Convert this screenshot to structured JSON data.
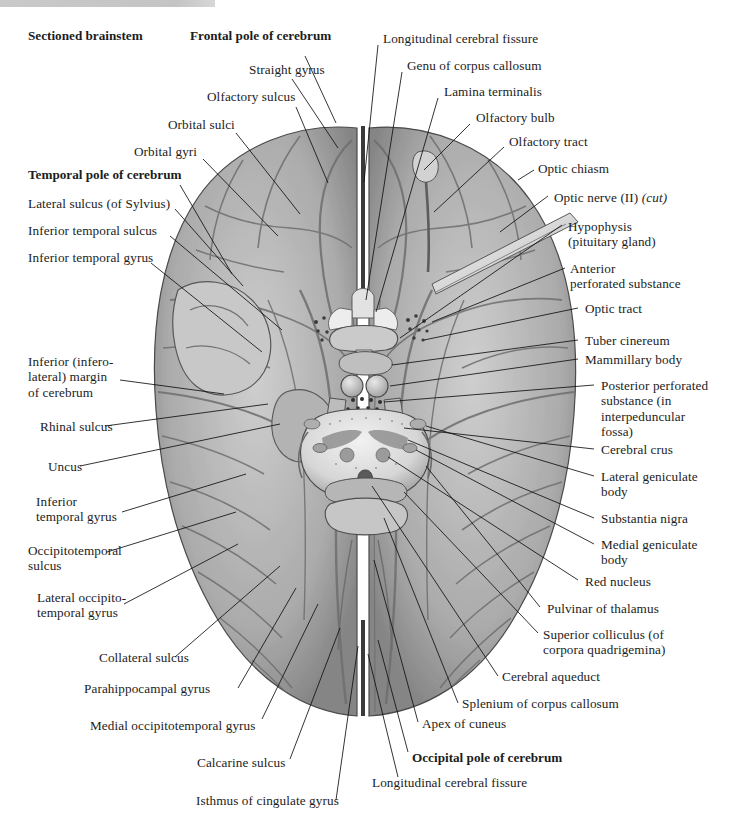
{
  "figure": {
    "kind": "anatomical-illustration",
    "top_rule_color": "#c7c7c7"
  },
  "labels": {
    "sectioned_brainstem": "Sectioned brainstem",
    "frontal_pole": "Frontal pole of cerebrum",
    "longitudinal_fissure_top": "Longitudinal cerebral fissure",
    "straight_gyrus": "Straight gyrus",
    "genu_corpus_callosum": "Genu of corpus callosum",
    "olfactory_sulcus": "Olfactory sulcus",
    "lamina_terminalis": "Lamina terminalis",
    "orbital_sulci": "Orbital sulci",
    "olfactory_bulb": "Olfactory bulb",
    "orbital_gyri": "Orbital gyri",
    "olfactory_tract": "Olfactory tract",
    "temporal_pole": "Temporal pole of cerebrum",
    "optic_chiasm": "Optic chiasm",
    "optic_nerve_a": "Optic nerve (II) ",
    "optic_nerve_cut": "(cut)",
    "lateral_sulcus": "Lateral sulcus (of Sylvius)",
    "hypophysis_l1": "Hypophysis",
    "hypophysis_l2": "(pituitary gland)",
    "inferior_temporal_sulcus": "Inferior temporal sulcus",
    "inferior_temporal_gyrus_top": "Inferior temporal gyrus",
    "anterior_perforated_l1": "Anterior",
    "anterior_perforated_l2": "perforated substance",
    "optic_tract": "Optic tract",
    "tuber_cinereum": "Tuber cinereum",
    "mammillary_body": "Mammillary body",
    "infero_margin_l1": "Inferior (infero-",
    "infero_margin_l2": "lateral) margin",
    "infero_margin_l3": "of cerebrum",
    "posterior_perf_l1": "Posterior perforated",
    "posterior_perf_l2": "substance (in",
    "posterior_perf_l3": "interpeduncular",
    "posterior_perf_l4": "fossa)",
    "rhinal_sulcus": "Rhinal sulcus",
    "cerebral_crus": "Cerebral crus",
    "uncus": "Uncus",
    "lateral_geniculate_l1": "Lateral geniculate",
    "lateral_geniculate_l2": "body",
    "inferior_temporal_gyrus_l1": "Inferior",
    "inferior_temporal_gyrus_l2": "temporal gyrus",
    "substantia_nigra": "Substantia nigra",
    "medial_geniculate_l1": "Medial geniculate",
    "medial_geniculate_l2": "body",
    "occipitotemporal_l1": "Occipitotemporal",
    "occipitotemporal_l2": "sulcus",
    "red_nucleus": "Red nucleus",
    "pulvinar": "Pulvinar of thalamus",
    "lateral_occipitotemporal_l1": "Lateral occipito-",
    "lateral_occipitotemporal_l2": "temporal gyrus",
    "superior_colliculus_l1": "Superior colliculus (of",
    "superior_colliculus_l2": "corpora quadrigemina)",
    "collateral_sulcus": "Collateral sulcus",
    "cerebral_aqueduct": "Cerebral aqueduct",
    "parahippocampal_gyrus": "Parahippocampal gyrus",
    "splenium": "Splenium of corpus callosum",
    "medial_occipitotemporal_gyrus": "Medial occipitotemporal gyrus",
    "apex_of_cuneus": "Apex of cuneus",
    "calcarine_sulcus": "Calcarine sulcus",
    "occipital_pole": "Occipital pole of cerebrum",
    "longitudinal_fissure_bottom": "Longitudinal cerebral fissure",
    "isthmus_cingulate": "Isthmus of cingulate gyrus"
  }
}
